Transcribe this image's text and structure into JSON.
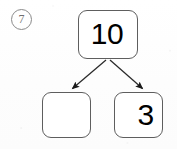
{
  "worksheet": {
    "problem_number": "7",
    "problem_number_style": "circled",
    "type": "number-bond",
    "instruction_visible": false,
    "ink_color": "#000000",
    "box_border_color": "#5e5e5e",
    "circle_border_color": "#8a8a8a",
    "background_color": "#ffffff"
  },
  "number_bond": {
    "whole": {
      "label": "10",
      "filled": true
    },
    "parts": [
      {
        "label": "",
        "filled": false,
        "position": "left"
      },
      {
        "label": "3",
        "filled": true,
        "position": "right"
      }
    ],
    "arrows": [
      {
        "name": "arrow-to-left-part",
        "from": "whole",
        "to": "part-left",
        "direction": "down-left"
      },
      {
        "name": "arrow-to-right-part",
        "from": "whole",
        "to": "part-right",
        "direction": "down-right"
      }
    ]
  }
}
